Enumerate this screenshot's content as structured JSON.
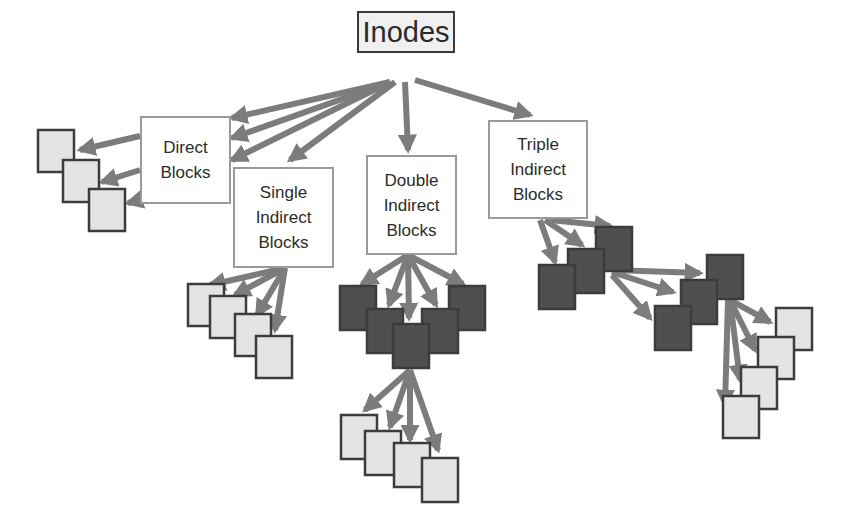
{
  "root": {
    "label": "Inodes"
  },
  "categories": [
    {
      "id": "direct",
      "lines": [
        "Direct",
        "Blocks"
      ]
    },
    {
      "id": "single",
      "lines": [
        "Single",
        "Indirect",
        "Blocks"
      ]
    },
    {
      "id": "double",
      "lines": [
        "Double",
        "Indirect",
        "Blocks"
      ]
    },
    {
      "id": "triple",
      "lines": [
        "Triple",
        "Indirect",
        "Blocks"
      ]
    }
  ],
  "colors": {
    "arrow": "#7c7c7c",
    "data_block_fill": "#e4e4e4",
    "indirect_block_fill": "#4f4f4f",
    "block_border": "#3c3c3c",
    "box_border": "#9a9a9a"
  }
}
